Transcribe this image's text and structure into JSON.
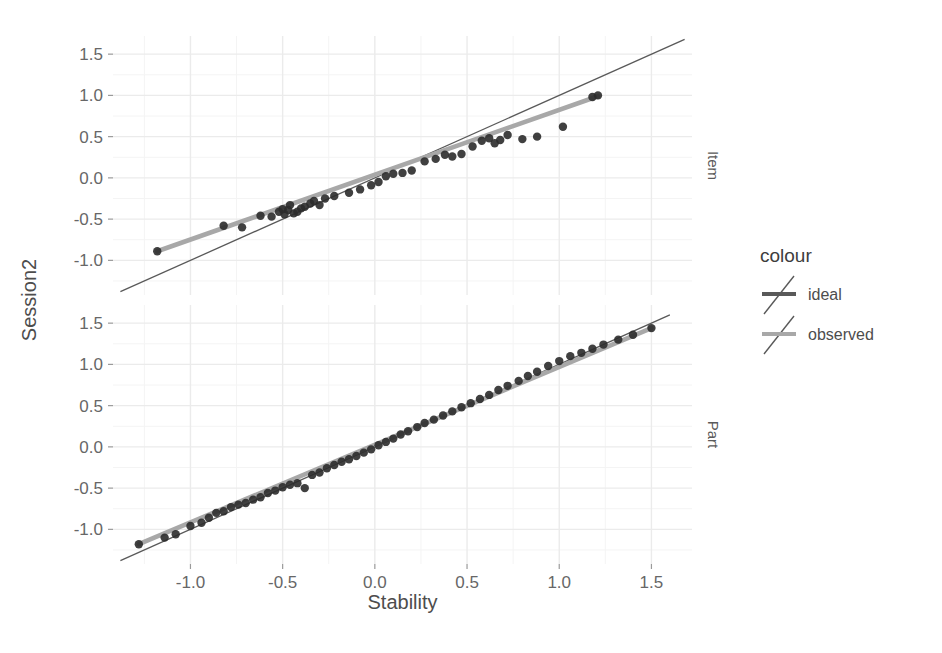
{
  "chart_data": {
    "type": "scatter",
    "title": "",
    "xlabel": "Stability",
    "ylabel": "Session2",
    "xlim": [
      -1.42,
      1.72
    ],
    "ylim_item": [
      -1.42,
      1.72
    ],
    "ylim_part": [
      -1.42,
      1.72
    ],
    "x_ticks": [
      -1.0,
      -0.5,
      0.0,
      0.5,
      1.0,
      1.5
    ],
    "x_tick_labels": [
      "-1.0",
      "-0.5",
      "0.0",
      "0.5",
      "1.0",
      "1.5"
    ],
    "y_ticks": [
      -1.0,
      -0.5,
      0.0,
      0.5,
      1.0,
      1.5
    ],
    "y_tick_labels": [
      "-1.0",
      "-0.5",
      "0.0",
      "0.5",
      "1.0",
      "1.5"
    ],
    "grid": true,
    "grid_minor": true,
    "legend_position": "right",
    "facet_variable": "",
    "facets": [
      {
        "name": "Item",
        "strip_label": "Item",
        "point_color": "#2b2b2b",
        "points": [
          {
            "x": -1.18,
            "y": -0.89
          },
          {
            "x": -0.82,
            "y": -0.58
          },
          {
            "x": -0.72,
            "y": -0.6
          },
          {
            "x": -0.62,
            "y": -0.46
          },
          {
            "x": -0.56,
            "y": -0.47
          },
          {
            "x": -0.52,
            "y": -0.41
          },
          {
            "x": -0.5,
            "y": -0.38
          },
          {
            "x": -0.49,
            "y": -0.44
          },
          {
            "x": -0.47,
            "y": -0.39
          },
          {
            "x": -0.46,
            "y": -0.33
          },
          {
            "x": -0.44,
            "y": -0.43
          },
          {
            "x": -0.42,
            "y": -0.41
          },
          {
            "x": -0.4,
            "y": -0.37
          },
          {
            "x": -0.38,
            "y": -0.35
          },
          {
            "x": -0.35,
            "y": -0.31
          },
          {
            "x": -0.33,
            "y": -0.28
          },
          {
            "x": -0.3,
            "y": -0.33
          },
          {
            "x": -0.27,
            "y": -0.25
          },
          {
            "x": -0.22,
            "y": -0.22
          },
          {
            "x": -0.14,
            "y": -0.18
          },
          {
            "x": -0.08,
            "y": -0.14
          },
          {
            "x": -0.02,
            "y": -0.09
          },
          {
            "x": 0.02,
            "y": -0.05
          },
          {
            "x": 0.06,
            "y": 0.02
          },
          {
            "x": 0.1,
            "y": 0.05
          },
          {
            "x": 0.15,
            "y": 0.06
          },
          {
            "x": 0.2,
            "y": 0.09
          },
          {
            "x": 0.27,
            "y": 0.2
          },
          {
            "x": 0.33,
            "y": 0.23
          },
          {
            "x": 0.38,
            "y": 0.28
          },
          {
            "x": 0.42,
            "y": 0.26
          },
          {
            "x": 0.47,
            "y": 0.29
          },
          {
            "x": 0.53,
            "y": 0.38
          },
          {
            "x": 0.58,
            "y": 0.45
          },
          {
            "x": 0.62,
            "y": 0.48
          },
          {
            "x": 0.65,
            "y": 0.42
          },
          {
            "x": 0.68,
            "y": 0.46
          },
          {
            "x": 0.72,
            "y": 0.52
          },
          {
            "x": 0.8,
            "y": 0.47
          },
          {
            "x": 0.88,
            "y": 0.5
          },
          {
            "x": 1.02,
            "y": 0.62
          },
          {
            "x": 1.18,
            "y": 0.98
          },
          {
            "x": 1.21,
            "y": 1.0
          }
        ],
        "ideal_line": {
          "x0": -1.38,
          "y0": -1.38,
          "x1": 1.68,
          "y1": 1.68
        },
        "observed_line": {
          "x0": -1.18,
          "y0": -0.89,
          "x1": 1.21,
          "y1": 0.99
        }
      },
      {
        "name": "Part",
        "strip_label": "Part",
        "point_color": "#2b2b2b",
        "points": [
          {
            "x": -1.28,
            "y": -1.18
          },
          {
            "x": -1.14,
            "y": -1.1
          },
          {
            "x": -1.08,
            "y": -1.06
          },
          {
            "x": -1.0,
            "y": -0.96
          },
          {
            "x": -0.94,
            "y": -0.92
          },
          {
            "x": -0.9,
            "y": -0.86
          },
          {
            "x": -0.86,
            "y": -0.8
          },
          {
            "x": -0.82,
            "y": -0.78
          },
          {
            "x": -0.78,
            "y": -0.73
          },
          {
            "x": -0.74,
            "y": -0.7
          },
          {
            "x": -0.7,
            "y": -0.68
          },
          {
            "x": -0.66,
            "y": -0.64
          },
          {
            "x": -0.62,
            "y": -0.61
          },
          {
            "x": -0.58,
            "y": -0.56
          },
          {
            "x": -0.54,
            "y": -0.53
          },
          {
            "x": -0.5,
            "y": -0.49
          },
          {
            "x": -0.46,
            "y": -0.46
          },
          {
            "x": -0.42,
            "y": -0.44
          },
          {
            "x": -0.38,
            "y": -0.5
          },
          {
            "x": -0.34,
            "y": -0.34
          },
          {
            "x": -0.3,
            "y": -0.31
          },
          {
            "x": -0.26,
            "y": -0.26
          },
          {
            "x": -0.22,
            "y": -0.22
          },
          {
            "x": -0.18,
            "y": -0.18
          },
          {
            "x": -0.14,
            "y": -0.15
          },
          {
            "x": -0.1,
            "y": -0.11
          },
          {
            "x": -0.06,
            "y": -0.07
          },
          {
            "x": -0.02,
            "y": -0.03
          },
          {
            "x": 0.02,
            "y": 0.02
          },
          {
            "x": 0.06,
            "y": 0.06
          },
          {
            "x": 0.1,
            "y": 0.1
          },
          {
            "x": 0.14,
            "y": 0.15
          },
          {
            "x": 0.18,
            "y": 0.19
          },
          {
            "x": 0.23,
            "y": 0.24
          },
          {
            "x": 0.27,
            "y": 0.29
          },
          {
            "x": 0.32,
            "y": 0.33
          },
          {
            "x": 0.37,
            "y": 0.38
          },
          {
            "x": 0.42,
            "y": 0.43
          },
          {
            "x": 0.47,
            "y": 0.48
          },
          {
            "x": 0.52,
            "y": 0.53
          },
          {
            "x": 0.57,
            "y": 0.58
          },
          {
            "x": 0.62,
            "y": 0.63
          },
          {
            "x": 0.67,
            "y": 0.69
          },
          {
            "x": 0.72,
            "y": 0.74
          },
          {
            "x": 0.78,
            "y": 0.8
          },
          {
            "x": 0.83,
            "y": 0.86
          },
          {
            "x": 0.88,
            "y": 0.91
          },
          {
            "x": 0.94,
            "y": 0.98
          },
          {
            "x": 1.0,
            "y": 1.04
          },
          {
            "x": 1.06,
            "y": 1.1
          },
          {
            "x": 1.12,
            "y": 1.14
          },
          {
            "x": 1.18,
            "y": 1.19
          },
          {
            "x": 1.24,
            "y": 1.24
          },
          {
            "x": 1.32,
            "y": 1.3
          },
          {
            "x": 1.4,
            "y": 1.36
          },
          {
            "x": 1.5,
            "y": 1.44
          }
        ],
        "ideal_line": {
          "x0": -1.38,
          "y0": -1.38,
          "x1": 1.6,
          "y1": 1.6
        },
        "observed_line": {
          "x0": -1.28,
          "y0": -1.18,
          "x1": 1.5,
          "y1": 1.44
        }
      }
    ],
    "legend": {
      "title": "colour",
      "entries": [
        {
          "label": "ideal",
          "color": "#595959"
        },
        {
          "label": "observed",
          "color": "#a8a8a8"
        }
      ]
    },
    "colors": {
      "ideal": "#595959",
      "observed": "#a8a8a8",
      "point": "#2b2b2b",
      "grid_major": "#ebebeb",
      "grid_minor": "#f4f4f4",
      "panel_background": "#ffffff",
      "text": "#4d4d4d"
    }
  }
}
